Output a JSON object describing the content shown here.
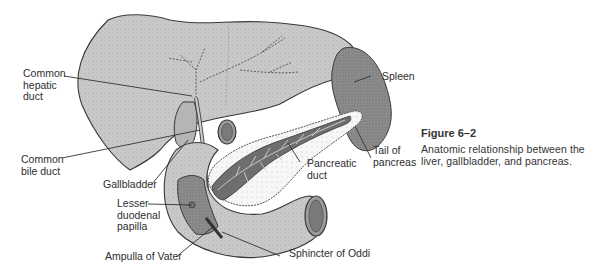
{
  "figure": {
    "number": "Figure 6–2",
    "caption": "Anatomic relationship between the liver, gallbladder, and pancreas."
  },
  "labels": {
    "common_hepatic_duct": "Common\nhepatic\nduct",
    "common_bile_duct": "Common\nbile duct",
    "gallbladder": "Gallbladder",
    "lesser_duodenal_papilla": "Lesser\nduodenal\npapilla",
    "ampulla_of_vater": "Ampulla of Vater",
    "spleen": "Spleen",
    "tail_of_pancreas": "Tail of\npancreas",
    "pancreatic_duct": "Pancreatic\nduct",
    "sphincter_of_oddi": "Sphincter of Oddi"
  },
  "colors": {
    "liver": "#c9c9c9",
    "spleen": "#8f8f8f",
    "pancreas": "#f2f2f2",
    "pancreatic_duct": "#6a6a6a",
    "duodenum": "#bdbdbd",
    "outline": "#3a3a3a"
  }
}
